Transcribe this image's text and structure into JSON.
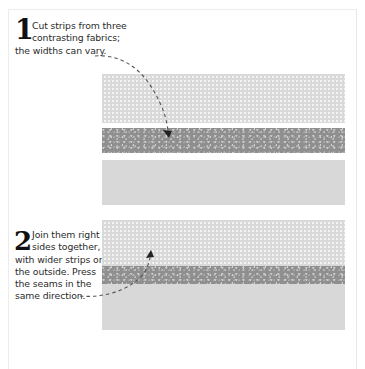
{
  "steps": [
    {
      "number": "1",
      "lines": [
        "Cut strips from three",
        "contrasting fabrics;",
        "the widths can vary."
      ]
    },
    {
      "number": "2",
      "lines": [
        "Join them right",
        "sides together,",
        "with wider strips on",
        "the outside. Press",
        "the seams in the",
        "same direction."
      ]
    }
  ],
  "illustrations": {
    "separate_strips": [
      {
        "fabric": "dotted",
        "color": "#d9d9d9"
      },
      {
        "fabric": "speckled",
        "color": "#8f8f8f"
      },
      {
        "fabric": "plain",
        "color": "#d8d8d8"
      }
    ],
    "joined_strips": [
      {
        "fabric": "dotted",
        "color": "#d9d9d9"
      },
      {
        "fabric": "speckled",
        "color": "#8f8f8f"
      },
      {
        "fabric": "plain",
        "color": "#d8d8d8"
      }
    ]
  },
  "colors": {
    "text": "#2b2b2b",
    "number": "#111111",
    "arrow": "#555555",
    "page_border": "#ececec"
  }
}
